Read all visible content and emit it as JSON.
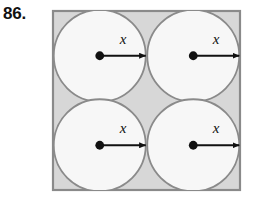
{
  "figure": {
    "problem_number": "86.",
    "colors": {
      "page_background": "#ffffff",
      "square_fill": "#d7d7d7",
      "square_stroke": "#8a8a8a",
      "circle_fill": "#f7f7f7",
      "circle_stroke": "#8a8a8a",
      "arrow_color": "#111111",
      "center_dot_color": "#111111",
      "label_color": "#111111"
    },
    "square": {
      "name": "outer-square",
      "x": 53,
      "y": 11,
      "width": 187,
      "height": 179,
      "stroke_width": 2.2
    },
    "circles": [
      {
        "name": "circle-top-left",
        "cx": 99.75,
        "cy": 55.75,
        "r": 46.0,
        "stroke_width": 1.8,
        "radius_label": "x",
        "label_x": 123,
        "label_y": 44,
        "dot": {
          "cx": 99.75,
          "cy": 55.75,
          "r": 4.4
        },
        "arrow": {
          "x1": 99.75,
          "y1": 55.75,
          "x2": 145.75,
          "y2": 55.75
        }
      },
      {
        "name": "circle-top-right",
        "cx": 193.25,
        "cy": 55.75,
        "r": 46.0,
        "stroke_width": 1.8,
        "radius_label": "x",
        "label_x": 216,
        "label_y": 44,
        "dot": {
          "cx": 193.25,
          "cy": 55.75,
          "r": 4.4
        },
        "arrow": {
          "x1": 193.25,
          "y1": 55.75,
          "x2": 239.25,
          "y2": 55.75
        }
      },
      {
        "name": "circle-bottom-left",
        "cx": 99.75,
        "cy": 145.25,
        "r": 46.0,
        "stroke_width": 1.8,
        "radius_label": "x",
        "label_x": 123,
        "label_y": 133,
        "dot": {
          "cx": 99.75,
          "cy": 145.25,
          "r": 4.4
        },
        "arrow": {
          "x1": 99.75,
          "y1": 145.25,
          "x2": 145.75,
          "y2": 145.25
        }
      },
      {
        "name": "circle-bottom-right",
        "cx": 193.25,
        "cy": 145.25,
        "r": 46.0,
        "stroke_width": 1.8,
        "radius_label": "x",
        "label_x": 216,
        "label_y": 133,
        "dot": {
          "cx": 193.25,
          "cy": 145.25,
          "r": 4.4
        },
        "arrow": {
          "x1": 193.25,
          "y1": 145.25,
          "x2": 239.25,
          "y2": 145.25
        }
      }
    ],
    "labels": {
      "radius_variable": "x",
      "count": 4
    }
  }
}
